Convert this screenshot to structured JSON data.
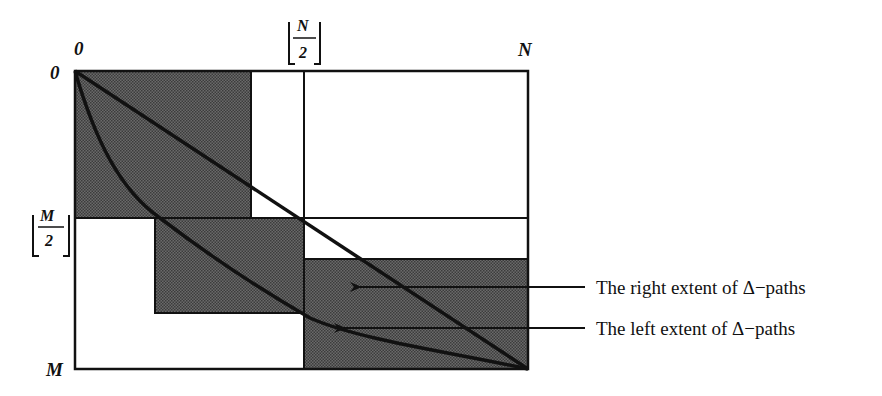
{
  "diagram": {
    "type": "edit-graph-band-diagram",
    "labels": {
      "origin_x": "0",
      "origin_y": "0",
      "n_label": "N",
      "m_label": "M",
      "half_n_num": "N",
      "half_n_den": "2",
      "half_m_num": "M",
      "half_m_den": "2"
    },
    "legend": [
      {
        "text": "The right extent of Δ−paths",
        "points_to": "straight-diagonal"
      },
      {
        "text": "The left extent of Δ−paths",
        "points_to": "curved-path"
      }
    ],
    "colors": {
      "shade": "#5a5a5a",
      "line": "#111111",
      "background": "#ffffff"
    },
    "regions": [
      {
        "name": "top-left-shaded-block",
        "x_range": [
          "0",
          "~N/2 - a"
        ],
        "y_range": [
          "0",
          "M/2"
        ]
      },
      {
        "name": "middle-shaded-block",
        "x_range": [
          "~N/5",
          "N/2"
        ],
        "y_range": [
          "M/2",
          "~3M/4"
        ]
      },
      {
        "name": "bottom-right-shaded-block",
        "x_range": [
          "N/2",
          "N"
        ],
        "y_range": [
          "~M/2 + b",
          "M"
        ]
      }
    ]
  }
}
